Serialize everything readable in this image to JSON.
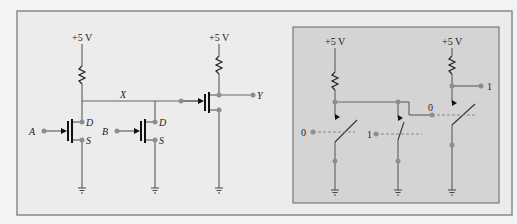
{
  "colors": {
    "background": "#f3f3f3",
    "frame_fill": "#ececec",
    "frame_border": "#8a8a8a",
    "panel_fill": "#d4d4d4",
    "panel_border": "#7a7a7a",
    "wire": "#666666",
    "node": "#8e8e8e",
    "gate": "#111111"
  },
  "left_circuit": {
    "supply_1": "+5 V",
    "supply_2": "+5 V",
    "node_x_label": "X",
    "input_a_label": "A",
    "input_b_label": "B",
    "output_y_label": "Y",
    "transistor_a": {
      "drain": "D",
      "source": "S"
    },
    "transistor_b": {
      "drain": "D",
      "source": "S"
    }
  },
  "right_panel": {
    "supply_1": "+5 V",
    "supply_2": "+5 V",
    "switch_1_input": "0",
    "switch_2_input": "1",
    "switch_3_input": "0",
    "output": "1"
  }
}
